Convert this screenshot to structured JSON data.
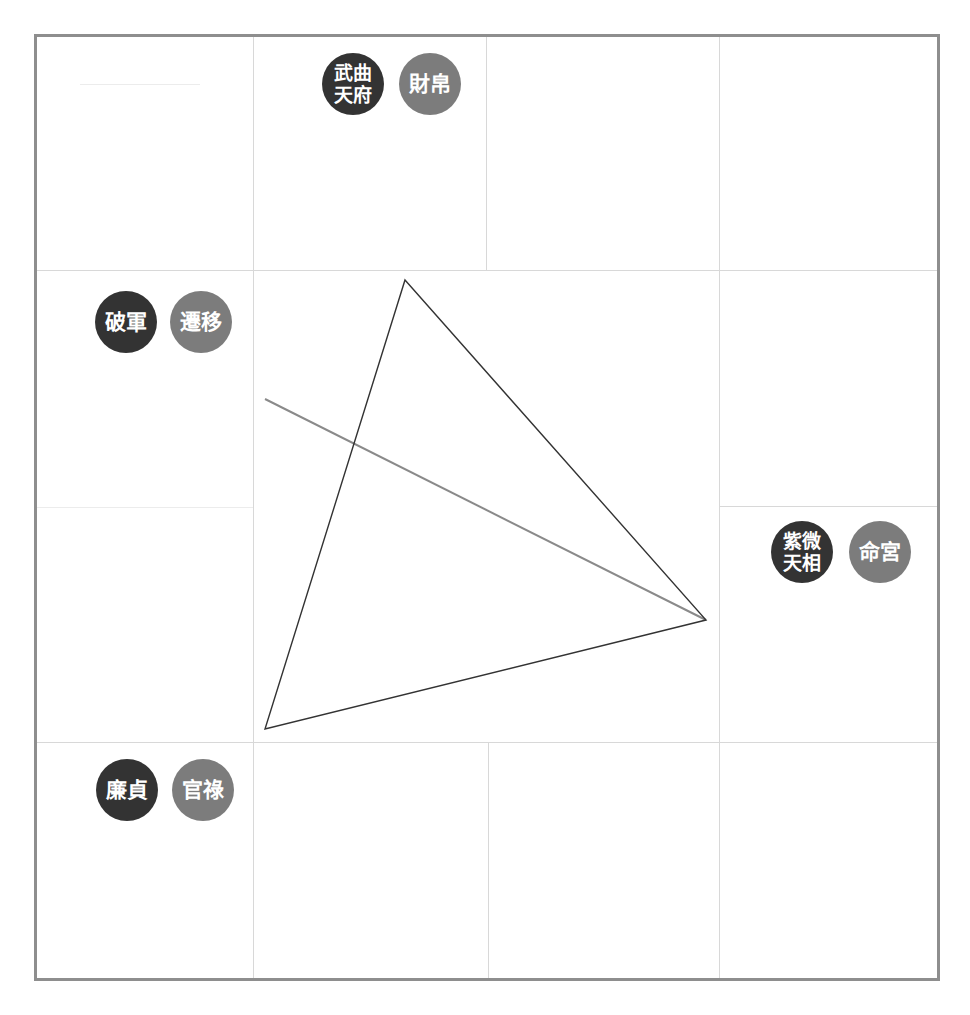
{
  "diagram": {
    "type": "ziwei-palace-grid",
    "colors": {
      "border": "#8e8e8e",
      "grid": "#d8d8d8",
      "star_badge": "#333333",
      "palace_badge": "#7c7c7c",
      "triangle": "#333333",
      "line": "#8a8a8a"
    },
    "palaces": [
      {
        "id": "wealth",
        "stars_line1": "武曲",
        "stars_line2": "天府",
        "palace": "財帛"
      },
      {
        "id": "travel",
        "stars": "破軍",
        "palace": "遷移"
      },
      {
        "id": "life",
        "stars_line1": "紫微",
        "stars_line2": "天相",
        "palace": "命宮"
      },
      {
        "id": "career",
        "stars": "廉貞",
        "palace": "官祿"
      }
    ],
    "triangle": {
      "points": [
        [
          405,
          280
        ],
        [
          706,
          620
        ],
        [
          265,
          729
        ]
      ]
    },
    "opposition_line": {
      "from": [
        265,
        399
      ],
      "to": [
        706,
        620
      ]
    }
  }
}
